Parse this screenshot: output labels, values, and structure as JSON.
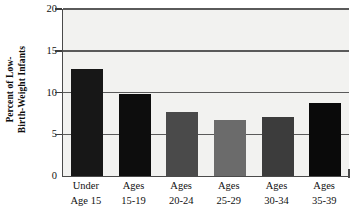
{
  "chart_data": {
    "type": "bar",
    "title": "",
    "xlabel": "",
    "ylabel": "Percent of Low-Birth-Weight Infants",
    "ylabel_lines": [
      "Percent of Low-",
      "Birth-Weight Infants"
    ],
    "categories": [
      "Under Age 15",
      "Ages 15-19",
      "Ages 20-24",
      "Ages 25-29",
      "Ages 30-34",
      "Ages 35-39"
    ],
    "category_lines": [
      [
        "Under",
        "Age 15"
      ],
      [
        "Ages",
        "15-19"
      ],
      [
        "Ages",
        "20-24"
      ],
      [
        "Ages",
        "25-29"
      ],
      [
        "Ages",
        "30-34"
      ],
      [
        "Ages",
        "35-39"
      ]
    ],
    "values": [
      12.8,
      9.8,
      7.7,
      6.7,
      7.1,
      8.8
    ],
    "bar_colors": [
      "#171717",
      "#0d0d0d",
      "#4a4a4a",
      "#6b6b6b",
      "#3c3c3c",
      "#0a0a0a"
    ],
    "ylim": [
      0,
      20
    ],
    "yticks": [
      0,
      5,
      10,
      15,
      20
    ],
    "ytick_labels": [
      "0",
      "5",
      "10",
      "15",
      "20"
    ],
    "grid": true,
    "gridlines_at": [
      5,
      10,
      15,
      20
    ],
    "legend": null,
    "plot_background": "#f2f2f0",
    "axis_color": "#4a4a4a"
  }
}
